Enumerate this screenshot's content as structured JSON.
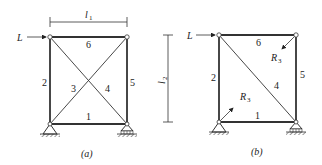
{
  "figure": {
    "panel_a": {
      "caption": "(a)",
      "load_label": "L",
      "dimension_label": "l",
      "dimension_sub": "1",
      "members": [
        "1",
        "2",
        "3",
        "4",
        "5",
        "6"
      ]
    },
    "panel_b": {
      "caption": "(b)",
      "load_label": "L",
      "dimension_label": "l",
      "dimension_sub": "2",
      "members": [
        "1",
        "2",
        "4",
        "5",
        "6"
      ],
      "redundant_label": "R",
      "redundant_sub": "3"
    },
    "colors": {
      "line": "#333333",
      "background": "#ffffff"
    }
  }
}
